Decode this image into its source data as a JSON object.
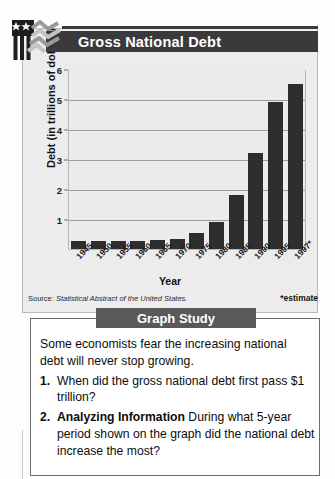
{
  "header": {
    "title": "Gross National Debt",
    "logo_icon": "flag-chart-logo-icon"
  },
  "chart_data": {
    "type": "bar",
    "title": "Gross National Debt",
    "xlabel": "Year",
    "ylabel": "Debt (in trillions of dollars)",
    "categories": [
      "1945",
      "1950",
      "1955",
      "1960",
      "1965",
      "1970",
      "1975",
      "1980",
      "1985",
      "1990",
      "1995",
      "1997*"
    ],
    "values": [
      0.26,
      0.26,
      0.27,
      0.28,
      0.31,
      0.35,
      0.55,
      0.9,
      1.8,
      3.2,
      4.9,
      5.5
    ],
    "ylim": [
      0,
      6
    ],
    "yticks": [
      1,
      2,
      3,
      4,
      5,
      6
    ],
    "grid": true,
    "legend": "none",
    "bar_color": "#2e2e30",
    "plot_background": "#ebebec",
    "annotations": {
      "estimate_note": "*estimate",
      "source": "Source: Statistical Abstract of the United States."
    }
  },
  "source": {
    "prefix": "Source: ",
    "italic_text": "Statistical Abstract of the United States.",
    "estimate": "*estimate"
  },
  "study": {
    "banner": "Graph Study",
    "intro": "Some economists fear the increasing national debt will never stop growing.",
    "questions": [
      {
        "number": "1.",
        "strong": "",
        "text": "When did the gross national debt first pass $1 trillion?"
      },
      {
        "number": "2.",
        "strong": "Analyzing Information",
        "text": " During what 5-year period shown on the graph did the national debt increase the most?"
      }
    ]
  },
  "colors": {
    "title_bar": "#3a3a3c",
    "banner": "#59595b",
    "bar": "#2e2e30",
    "card_bg": "#ececed"
  }
}
